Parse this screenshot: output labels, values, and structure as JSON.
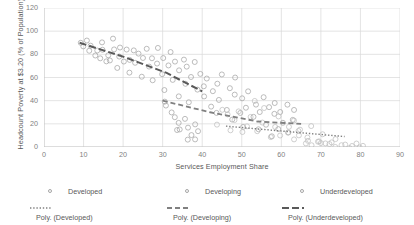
{
  "chart_data": {
    "type": "scatter",
    "title": "",
    "xlabel": "Services Employment Share",
    "ylabel": "Headcount Poverty at $3.20 (% of Population)",
    "xlim": [
      0,
      90
    ],
    "ylim": [
      0,
      120
    ],
    "xticks": [
      0,
      10,
      20,
      30,
      40,
      50,
      60,
      70,
      80,
      90
    ],
    "yticks": [
      0,
      20,
      40,
      60,
      80,
      100,
      120
    ],
    "grid": true,
    "legend_position": "bottom",
    "marker_style": "open-circle",
    "series": [
      {
        "name": "Underdeveloped",
        "marker_color": "#a6a6a6",
        "points": [
          [
            9.5,
            88
          ],
          [
            10.2,
            86
          ],
          [
            10.8,
            90
          ],
          [
            11.5,
            84
          ],
          [
            12.0,
            87
          ],
          [
            12.6,
            80
          ],
          [
            13.2,
            83
          ],
          [
            13.9,
            78
          ],
          [
            14.3,
            91
          ],
          [
            15.0,
            86
          ],
          [
            15.6,
            73
          ],
          [
            16.1,
            81
          ],
          [
            16.8,
            76
          ],
          [
            17.2,
            95
          ],
          [
            17.9,
            84
          ],
          [
            18.4,
            70
          ],
          [
            19.0,
            79
          ],
          [
            19.6,
            88
          ],
          [
            20.2,
            74
          ],
          [
            20.9,
            82
          ],
          [
            21.4,
            66
          ],
          [
            22.0,
            77
          ],
          [
            22.7,
            85
          ],
          [
            23.3,
            71
          ],
          [
            23.9,
            80
          ],
          [
            24.5,
            62
          ],
          [
            25.1,
            75
          ],
          [
            25.8,
            83
          ],
          [
            26.4,
            68
          ],
          [
            27.0,
            78
          ],
          [
            27.6,
            57
          ],
          [
            28.2,
            72
          ],
          [
            28.9,
            86
          ],
          [
            29.5,
            64
          ],
          [
            30.1,
            76
          ],
          [
            30.7,
            51
          ],
          [
            31.3,
            69
          ],
          [
            32.0,
            80
          ],
          [
            32.6,
            59
          ],
          [
            33.2,
            73
          ],
          [
            33.8,
            45
          ],
          [
            34.4,
            66
          ],
          [
            35.1,
            77
          ],
          [
            35.7,
            54
          ],
          [
            36.3,
            70
          ],
          [
            36.9,
            40
          ],
          [
            37.5,
            61
          ],
          [
            38.2,
            74
          ],
          [
            38.8,
            49
          ],
          [
            39.4,
            65
          ]
        ]
      },
      {
        "name": "Developing",
        "marker_color": "#a6a6a6",
        "points": [
          [
            30.5,
            38
          ],
          [
            31.2,
            36
          ],
          [
            32.0,
            30
          ],
          [
            32.8,
            24
          ],
          [
            33.4,
            16
          ],
          [
            34.0,
            22
          ],
          [
            34.7,
            13
          ],
          [
            35.3,
            26
          ],
          [
            36.0,
            8
          ],
          [
            36.6,
            18
          ],
          [
            37.3,
            12
          ],
          [
            38.0,
            20
          ],
          [
            38.6,
            6
          ],
          [
            39.2,
            14
          ],
          [
            40.0,
            52
          ],
          [
            40.6,
            44
          ],
          [
            41.3,
            60
          ],
          [
            42.0,
            35
          ],
          [
            42.7,
            48
          ],
          [
            43.3,
            28
          ],
          [
            44.0,
            56
          ],
          [
            44.6,
            40
          ],
          [
            45.3,
            64
          ],
          [
            46.0,
            33
          ],
          [
            46.7,
            50
          ],
          [
            47.3,
            22
          ],
          [
            48.0,
            45
          ],
          [
            48.6,
            58
          ],
          [
            49.3,
            30
          ],
          [
            50.0,
            42
          ],
          [
            50.7,
            18
          ],
          [
            51.3,
            36
          ],
          [
            52.0,
            49
          ],
          [
            52.7,
            26
          ],
          [
            53.3,
            38
          ],
          [
            54.0,
            14
          ],
          [
            54.7,
            32
          ],
          [
            55.3,
            44
          ],
          [
            56.0,
            20
          ],
          [
            56.7,
            34
          ],
          [
            57.3,
            10
          ],
          [
            58.0,
            28
          ],
          [
            58.7,
            40
          ],
          [
            59.3,
            17
          ],
          [
            60.0,
            30
          ],
          [
            60.7,
            22
          ],
          [
            61.3,
            36
          ],
          [
            62.0,
            12
          ],
          [
            62.7,
            25
          ],
          [
            63.3,
            33
          ]
        ]
      },
      {
        "name": "Developed",
        "marker_color": "#bfbfbf",
        "points": [
          [
            45.0,
            34
          ],
          [
            46.5,
            28
          ],
          [
            48.0,
            22
          ],
          [
            49.5,
            30
          ],
          [
            51.0,
            18
          ],
          [
            52.5,
            25
          ],
          [
            54.0,
            14
          ],
          [
            55.5,
            20
          ],
          [
            57.0,
            10
          ],
          [
            58.5,
            16
          ],
          [
            60.0,
            8
          ],
          [
            61.5,
            12
          ],
          [
            63.0,
            6
          ],
          [
            64.5,
            9
          ],
          [
            66.0,
            4
          ],
          [
            67.0,
            7
          ],
          [
            68.0,
            3
          ],
          [
            69.0,
            5
          ],
          [
            70.0,
            2
          ],
          [
            71.0,
            4
          ],
          [
            72.0,
            2
          ],
          [
            73.0,
            3
          ],
          [
            74.0,
            1
          ],
          [
            75.0,
            2
          ],
          [
            76.0,
            1
          ],
          [
            77.0,
            1
          ],
          [
            78.0,
            1
          ],
          [
            79.0,
            1
          ],
          [
            80.0,
            1
          ],
          [
            81.0,
            1
          ],
          [
            63.5,
            22
          ],
          [
            65.0,
            15
          ],
          [
            59.0,
            26
          ],
          [
            56.0,
            32
          ],
          [
            53.0,
            38
          ],
          [
            50.0,
            12
          ],
          [
            47.0,
            16
          ],
          [
            44.0,
            20
          ],
          [
            67.5,
            18
          ],
          [
            70.5,
            10
          ],
          [
            73.5,
            8
          ],
          [
            62.0,
            18
          ],
          [
            64.0,
            12
          ],
          [
            66.5,
            9
          ],
          [
            69.5,
            6
          ]
        ]
      }
    ],
    "trendlines": [
      {
        "name": "Poly. (Underdeveloped)",
        "style": "long-dash",
        "color": "#595959",
        "path": [
          [
            9,
            90
          ],
          [
            20,
            78
          ],
          [
            31,
            64
          ],
          [
            40,
            48
          ]
        ]
      },
      {
        "name": "Poly. (Developing)",
        "style": "dash",
        "color": "#808080",
        "path": [
          [
            30,
            40
          ],
          [
            42,
            30
          ],
          [
            54,
            22
          ],
          [
            65,
            20
          ]
        ]
      },
      {
        "name": "Poly. (Developed)",
        "style": "dot",
        "color": "#808080",
        "path": [
          [
            46,
            18
          ],
          [
            56,
            15
          ],
          [
            66,
            12
          ],
          [
            76,
            9
          ]
        ]
      }
    ]
  },
  "legend": {
    "row1": [
      {
        "label": "Developed",
        "marker": "open-circle-marker"
      },
      {
        "label": "Developing",
        "marker": "open-circle-marker"
      },
      {
        "label": "Underdeveloped",
        "marker": "open-circle-marker"
      }
    ],
    "row2": [
      {
        "label": "Poly. (Developed)",
        "marker": "dotted-line-marker"
      },
      {
        "label": "Poly. (Developing)",
        "marker": "dashed-line-marker"
      },
      {
        "label": "Poly. (Underdeveloped)",
        "marker": "long-dash-line-marker"
      }
    ]
  },
  "colors": {
    "grid": "#d9d9d9",
    "axis_text": "#7f7f7f",
    "title_text": "#595959",
    "marker_stroke": "#a6a6a6",
    "trend_dark": "#595959"
  }
}
